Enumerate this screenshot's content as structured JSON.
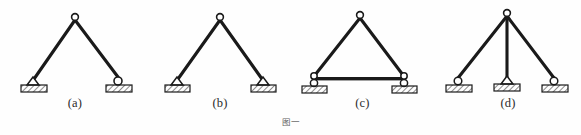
{
  "figure": {
    "caption": "图一",
    "background_color": "#fefefe",
    "line_color": "#1a1a1a",
    "hatch_color": "#2b2b2b",
    "ground_fill": "#e8e8e8",
    "joint_fill": "#ffffff"
  },
  "panels": [
    {
      "id": "a",
      "label": "(a)",
      "description": "two-bar three-hinged arch, left pin support, right roller support",
      "apex": {
        "x": 75,
        "y": 18
      },
      "members": [
        {
          "name": "left-member",
          "x1": 75,
          "y1": 18,
          "x2": 33,
          "y2": 80
        },
        {
          "name": "right-member",
          "x1": 75,
          "y1": 18,
          "x2": 119,
          "y2": 80
        }
      ],
      "supports": [
        {
          "name": "left-support",
          "type": "pin",
          "x": 33,
          "y": 80
        },
        {
          "name": "right-support",
          "type": "roller",
          "x": 119,
          "y": 80
        }
      ],
      "hinges": [
        {
          "name": "apex-hinge",
          "x": 75,
          "y": 18
        }
      ]
    },
    {
      "id": "b",
      "label": "(b)",
      "description": "two-bar three-hinged arch, both supports pinned",
      "apex": {
        "x": 70,
        "y": 18
      },
      "members": [
        {
          "name": "left-member",
          "x1": 70,
          "y1": 18,
          "x2": 27,
          "y2": 80
        },
        {
          "name": "right-member",
          "x1": 70,
          "y1": 18,
          "x2": 113,
          "y2": 80
        }
      ],
      "supports": [
        {
          "name": "left-support",
          "type": "pin",
          "x": 27,
          "y": 80
        },
        {
          "name": "right-support",
          "type": "pin",
          "x": 113,
          "y": 80
        }
      ],
      "hinges": [
        {
          "name": "apex-hinge",
          "x": 70,
          "y": 18
        }
      ]
    },
    {
      "id": "c",
      "label": "(c)",
      "description": "three-hinged arch with horizontal tie rod, both supports on rollers",
      "apex": {
        "x": 70,
        "y": 16
      },
      "members": [
        {
          "name": "left-member",
          "x1": 70,
          "y1": 16,
          "x2": 24,
          "y2": 76
        },
        {
          "name": "right-member",
          "x1": 70,
          "y1": 16,
          "x2": 113,
          "y2": 76
        },
        {
          "name": "tie-rod",
          "x1": 24,
          "y1": 79,
          "x2": 113,
          "y2": 79
        }
      ],
      "supports": [
        {
          "name": "left-support",
          "type": "roller",
          "x": 24,
          "y": 82
        },
        {
          "name": "right-support",
          "type": "roller",
          "x": 113,
          "y": 82
        }
      ],
      "hinges": [
        {
          "name": "apex-hinge",
          "x": 70,
          "y": 16
        },
        {
          "name": "left-hinge",
          "x": 24,
          "y": 77
        },
        {
          "name": "right-hinge",
          "x": 113,
          "y": 77
        }
      ]
    },
    {
      "id": "d",
      "label": "(d)",
      "description": "three members from common apex hinge, left roller, middle pin, right roller",
      "apex": {
        "x": 72,
        "y": 14
      },
      "members": [
        {
          "name": "left-member",
          "x1": 72,
          "y1": 14,
          "x2": 22,
          "y2": 80
        },
        {
          "name": "middle-member",
          "x1": 72,
          "y1": 14,
          "x2": 72,
          "y2": 82
        },
        {
          "name": "right-member",
          "x1": 72,
          "y1": 14,
          "x2": 119,
          "y2": 80
        }
      ],
      "supports": [
        {
          "name": "left-support",
          "type": "roller",
          "x": 22,
          "y": 80
        },
        {
          "name": "middle-support",
          "type": "pin",
          "x": 72,
          "y": 82
        },
        {
          "name": "right-support",
          "type": "roller",
          "x": 119,
          "y": 80
        }
      ],
      "hinges": [
        {
          "name": "apex-hinge",
          "x": 72,
          "y": 14
        }
      ]
    }
  ]
}
